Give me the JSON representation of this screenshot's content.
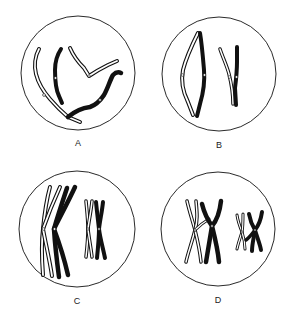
{
  "figure": {
    "panels": [
      {
        "id": "A",
        "label": "A",
        "content": "Unpaired thread-like homologous chromosomes (leptotene)"
      },
      {
        "id": "B",
        "label": "B",
        "content": "Homologues beginning to pair/synapse (zygotene)"
      },
      {
        "id": "C",
        "label": "C",
        "content": "Paired homologues condensed, each with two chromatids (pachytene/diplotene)"
      },
      {
        "id": "D",
        "label": "D",
        "content": "Crossing over / chiasmata between homologues (diplotene)"
      }
    ]
  },
  "colors": {
    "background": "#ffffff",
    "line": "#111111",
    "light_chromosome_fill": "#ffffff",
    "dark_chromosome_fill": "#111111"
  }
}
